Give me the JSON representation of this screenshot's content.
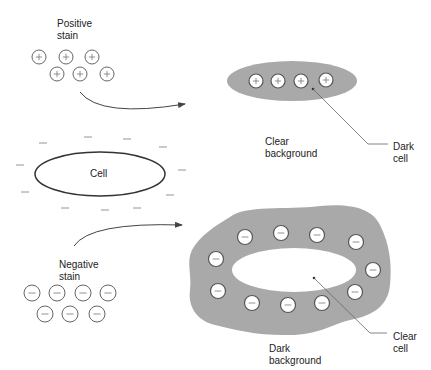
{
  "colors": {
    "stain_gray": "#a9a9a9",
    "outline": "#333333",
    "circle_fill": "#ffffff",
    "circle_stroke": "#555555",
    "leader_line": "#666666"
  },
  "labels": {
    "positive_stain": "Positive\nstain",
    "negative_stain": "Negative\nstain",
    "cell": "Cell",
    "clear_background": "Clear\nbackground",
    "dark_cell": "Dark\ncell",
    "dark_background": "Dark\nbackground",
    "clear_cell": "Clear\ncell"
  },
  "glyphs": {
    "plus": "+",
    "minus": "—"
  },
  "positive_particles": [
    {
      "x": 39,
      "y": 57
    },
    {
      "x": 66,
      "y": 57
    },
    {
      "x": 92,
      "y": 57
    },
    {
      "x": 57,
      "y": 74
    },
    {
      "x": 80,
      "y": 74
    },
    {
      "x": 107,
      "y": 74
    }
  ],
  "negative_particles": [
    {
      "x": 32,
      "y": 293
    },
    {
      "x": 57,
      "y": 293
    },
    {
      "x": 83,
      "y": 293
    },
    {
      "x": 108,
      "y": 293
    },
    {
      "x": 45,
      "y": 314
    },
    {
      "x": 70,
      "y": 314
    },
    {
      "x": 97,
      "y": 314
    }
  ],
  "dark_cell_particles": [
    {
      "x": 256,
      "y": 81
    },
    {
      "x": 278,
      "y": 81
    },
    {
      "x": 301,
      "y": 81
    },
    {
      "x": 326,
      "y": 80
    }
  ],
  "dark_background_particles": [
    {
      "x": 245,
      "y": 237
    },
    {
      "x": 281,
      "y": 233
    },
    {
      "x": 317,
      "y": 235
    },
    {
      "x": 356,
      "y": 242
    },
    {
      "x": 216,
      "y": 259
    },
    {
      "x": 373,
      "y": 270
    },
    {
      "x": 218,
      "y": 291
    },
    {
      "x": 252,
      "y": 303
    },
    {
      "x": 288,
      "y": 305
    },
    {
      "x": 322,
      "y": 303
    },
    {
      "x": 355,
      "y": 292
    }
  ],
  "cell_surface_charges": [
    {
      "x": 43,
      "y": 143
    },
    {
      "x": 88,
      "y": 137
    },
    {
      "x": 127,
      "y": 139
    },
    {
      "x": 163,
      "y": 147
    },
    {
      "x": 20,
      "y": 165
    },
    {
      "x": 182,
      "y": 170
    },
    {
      "x": 25,
      "y": 192
    },
    {
      "x": 170,
      "y": 195
    },
    {
      "x": 65,
      "y": 208
    },
    {
      "x": 105,
      "y": 210
    },
    {
      "x": 137,
      "y": 208
    }
  ]
}
